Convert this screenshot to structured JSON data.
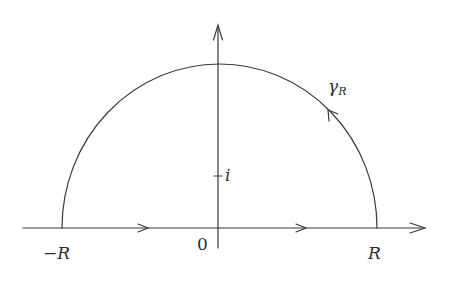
{
  "diagram": {
    "type": "contour-diagram",
    "colors": {
      "stroke": "#3a3a3a",
      "text": "#2b2b2b",
      "background": "#ffffff"
    },
    "axes": {
      "real_axis": {
        "arrow": true
      },
      "imaginary_axis": {
        "arrow": true
      }
    },
    "labels": {
      "minus_r": "−R",
      "r": "R",
      "origin": "0",
      "i_point": "i",
      "gamma": "γ",
      "gamma_sub": "R"
    },
    "marks": {
      "i_tick": "i"
    },
    "contour": {
      "segment": "[-R, R] on real axis, traversed left to right",
      "arc": "γ_R, upper semicircle traversed counterclockwise"
    }
  }
}
